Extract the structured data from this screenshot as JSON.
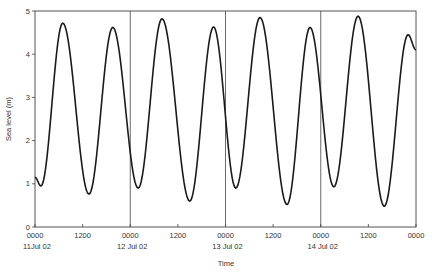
{
  "chart_data": {
    "type": "line",
    "title": "",
    "xlabel": "Time",
    "ylabel": "Sea level (m)",
    "ylim": [
      0,
      5
    ],
    "xlim_hours": [
      0,
      96
    ],
    "grid": false,
    "legend": null,
    "y_ticks": [
      0,
      1,
      2,
      3,
      4,
      5
    ],
    "x_ticks": [
      {
        "hour": 0,
        "time": "0000",
        "date": "11Jul 02"
      },
      {
        "hour": 12,
        "time": "1200",
        "date": ""
      },
      {
        "hour": 24,
        "time": "0000",
        "date": "12 Jul 02"
      },
      {
        "hour": 36,
        "time": "1200",
        "date": ""
      },
      {
        "hour": 48,
        "time": "0000",
        "date": "13 Jul 02"
      },
      {
        "hour": 60,
        "time": "1200",
        "date": ""
      },
      {
        "hour": 72,
        "time": "0000",
        "date": "14 Jul 02"
      },
      {
        "hour": 84,
        "time": "1200",
        "date": ""
      },
      {
        "hour": 96,
        "time": "0000",
        "date": ""
      }
    ],
    "day_dividers_hours": [
      24,
      48,
      72
    ],
    "series": [
      {
        "name": "Sea level",
        "color": "#1a1a1a",
        "points_hours": [
          0,
          1.5,
          7.0,
          13.6,
          19.6,
          26.0,
          32.0,
          39.0,
          45.0,
          50.6,
          56.7,
          63.5,
          69.3,
          75.3,
          81.4,
          88.0,
          94.0,
          96.0
        ],
        "values_m": [
          1.15,
          0.95,
          4.72,
          0.76,
          4.62,
          0.9,
          4.82,
          0.6,
          4.63,
          0.9,
          4.85,
          0.52,
          4.62,
          0.93,
          4.88,
          0.48,
          4.45,
          4.1
        ]
      }
    ]
  }
}
